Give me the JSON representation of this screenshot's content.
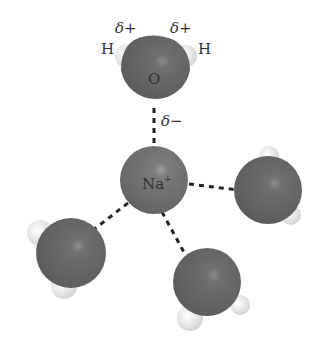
{
  "diagram": {
    "ion": {
      "label": "Na",
      "charge": "+"
    },
    "top_water": {
      "oxygen_label": "O",
      "hydrogen_left_label": "H",
      "hydrogen_right_label": "H",
      "partial_positive_left": "δ+",
      "partial_positive_right": "δ+",
      "partial_negative": "δ−"
    },
    "colors": {
      "oxygen": "#6e6e6e",
      "hydrogen": "#e8e8e8",
      "ion": "#7a7a7a",
      "bond": "#222222",
      "text": "#333333"
    },
    "water_molecule_count": 4
  }
}
